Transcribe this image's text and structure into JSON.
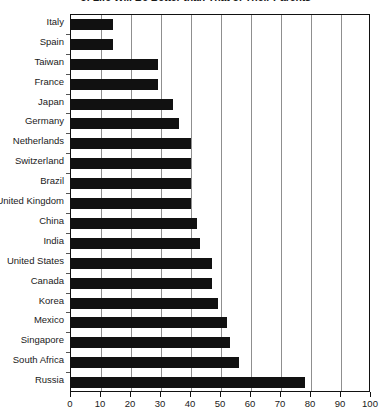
{
  "chart_data": {
    "type": "bar",
    "orientation": "horizontal",
    "title": "of Life Will Be Better than That of Their Parents",
    "xlabel": "",
    "ylabel": "",
    "xlim": [
      0,
      100
    ],
    "xticks": [
      0,
      10,
      20,
      30,
      40,
      50,
      60,
      70,
      80,
      90,
      100
    ],
    "grid": true,
    "grid_axis": "x",
    "legend": null,
    "bar_color": "#111111",
    "categories": [
      "Italy",
      "Spain",
      "Taiwan",
      "France",
      "Japan",
      "Germany",
      "Netherlands",
      "Switzerland",
      "Brazil",
      "United Kingdom",
      "China",
      "India",
      "United States",
      "Canada",
      "Korea",
      "Mexico",
      "Singapore",
      "South Africa",
      "Russia"
    ],
    "values": [
      14,
      14,
      29,
      29,
      34,
      36,
      40,
      40,
      40,
      40,
      42,
      43,
      47,
      47,
      49,
      52,
      53,
      56,
      78
    ]
  }
}
